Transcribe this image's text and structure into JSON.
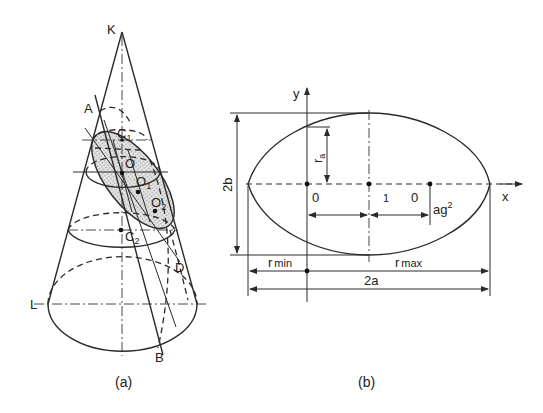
{
  "figure": {
    "panel_a": {
      "caption": "(a)",
      "points": {
        "K": "K",
        "A": "A",
        "C1": "C",
        "C1_sub": "1",
        "O": "O",
        "O1": "O",
        "O1_sub": "1",
        "O2": "O",
        "O2_sub": "2",
        "C2": "C",
        "C2_sub": "2",
        "D": "D",
        "L": "L",
        "B": "B"
      }
    },
    "panel_b": {
      "caption": "(b)",
      "axis_x": "x",
      "axis_y": "y",
      "dim_2b": "2b",
      "dim_ra": "r",
      "dim_ra_sub": "a",
      "origin_label": "0",
      "center_label": "1",
      "focus_label": "0",
      "ag2": "ag",
      "ag2_sup": "2",
      "r_min": "r",
      "r_min_sub": "min",
      "r_max": "r",
      "r_max_sub": "max",
      "dim_2a": "2a"
    },
    "colors": {
      "line": "#2a2a2a",
      "shade": "#cfcfcf",
      "background": "#ffffff"
    }
  }
}
